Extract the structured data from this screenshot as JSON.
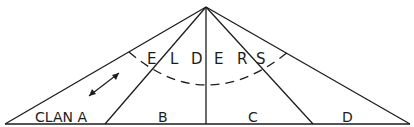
{
  "diagram": {
    "type": "pyramid-social-structure",
    "apex_label": "ELDERS",
    "elders_letters": [
      "E",
      "L",
      "D",
      "E",
      "R",
      "S"
    ],
    "sections": [
      {
        "id": "a",
        "label": "CLAN A"
      },
      {
        "id": "b",
        "label": "B"
      },
      {
        "id": "c",
        "label": "C"
      },
      {
        "id": "d",
        "label": "D"
      }
    ],
    "arrow": "double-headed-arrow",
    "colors": {
      "line": "#1c1c1c",
      "background": "#ffffff"
    }
  }
}
